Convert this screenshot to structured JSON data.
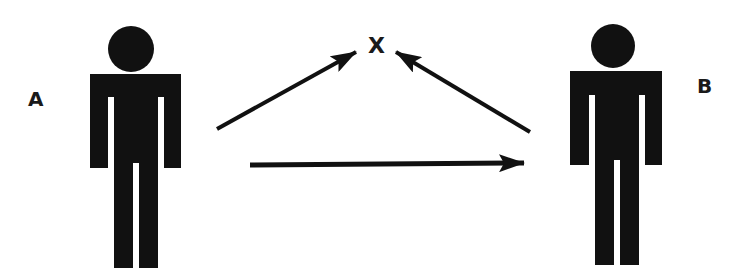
{
  "diagram": {
    "type": "triadic-relation",
    "nodes": [
      {
        "id": "A",
        "label": "A",
        "kind": "person-figure"
      },
      {
        "id": "B",
        "label": "B",
        "kind": "person-figure"
      },
      {
        "id": "X",
        "label": "X",
        "kind": "object"
      }
    ],
    "edges": [
      {
        "from": "A",
        "to": "X"
      },
      {
        "from": "B",
        "to": "X"
      },
      {
        "from": "A",
        "to": "B"
      }
    ],
    "colors": {
      "ink": "#111111",
      "background": "#ffffff"
    }
  }
}
